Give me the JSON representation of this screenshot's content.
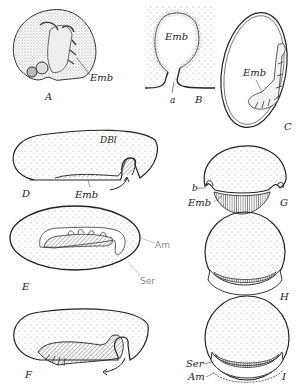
{
  "figure": {
    "panels": [
      {
        "id": "A",
        "label": "A",
        "annotations": [
          "Emb"
        ]
      },
      {
        "id": "B",
        "label": "B",
        "annotations": [
          "Emb",
          "a"
        ]
      },
      {
        "id": "C",
        "label": "C",
        "annotations": [
          "Emb"
        ]
      },
      {
        "id": "D",
        "label": "D",
        "annotations": [
          "DBl",
          "Emb"
        ]
      },
      {
        "id": "E",
        "label": "E",
        "annotations": [
          "Am",
          "Ser"
        ]
      },
      {
        "id": "F",
        "label": "F",
        "annotations": []
      },
      {
        "id": "G",
        "label": "G",
        "annotations": [
          "b",
          "Emb"
        ]
      },
      {
        "id": "H",
        "label": "H",
        "annotations": []
      },
      {
        "id": "I",
        "label": "I",
        "annotations": [
          "Ser",
          "Am"
        ]
      }
    ],
    "colors": {
      "ink": "#222222",
      "stipple": "#9a9a9a",
      "handwriting": "#888888",
      "background": "#ffffff"
    }
  }
}
